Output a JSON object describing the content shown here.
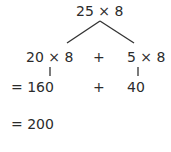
{
  "diagram": {
    "type": "partition-tree",
    "root": {
      "expression": "25 × 8"
    },
    "branches": [
      {
        "expression": "20 × 8",
        "result": "= 160"
      },
      {
        "expression": "5 × 8",
        "result": "40"
      }
    ],
    "operator_row1": "+",
    "operator_row2": "+",
    "final_result": "= 200"
  }
}
